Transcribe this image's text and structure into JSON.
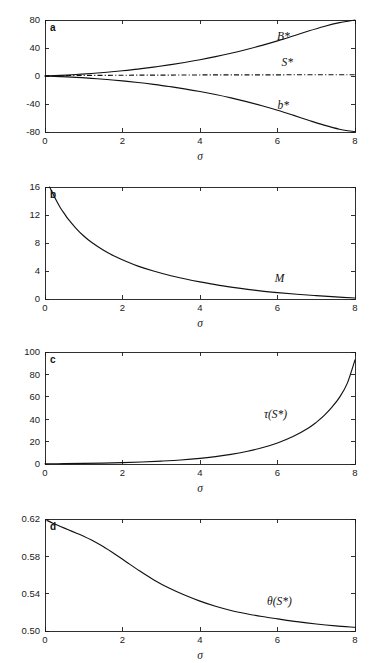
{
  "figure": {
    "background": "#ffffff",
    "ink_color": "#111111",
    "panel_count": 4
  },
  "chart_data": [
    {
      "type": "line",
      "panel": "a",
      "panel_label": "a",
      "title": "",
      "xlabel": "σ",
      "ylabel": "",
      "xlim": [
        0,
        8
      ],
      "ylim": [
        -80,
        80
      ],
      "xticks": [
        0,
        2,
        4,
        6,
        8
      ],
      "xticklabels": [
        "0",
        "2",
        "4",
        "6",
        "8"
      ],
      "yticks": [
        -80,
        -40,
        0,
        40,
        80
      ],
      "yticklabels": [
        "-80",
        "-40",
        "0",
        "40",
        "80"
      ],
      "grid": false,
      "legend": "none",
      "series": [
        {
          "name": "B*",
          "label": "B*",
          "label_x": 6.15,
          "label_y": 52,
          "style": "solid",
          "x": [
            0,
            0.4,
            0.8,
            1.2,
            1.6,
            2.0,
            2.4,
            2.8,
            3.2,
            3.6,
            4.0,
            4.4,
            4.8,
            5.2,
            5.6,
            6.0,
            6.4,
            6.8,
            7.2,
            7.6,
            8.0
          ],
          "values": [
            0,
            0.9,
            2.1,
            3.6,
            5.4,
            7.5,
            9.9,
            12.7,
            15.8,
            19.3,
            23.2,
            27.6,
            32.5,
            37.9,
            43.8,
            50.2,
            57.2,
            64.3,
            70.8,
            76.2,
            80.0
          ]
        },
        {
          "name": "S*",
          "label": "S*",
          "label_x": 6.25,
          "label_y": 14,
          "style": "dashdot",
          "x": [
            0,
            1,
            2,
            3,
            4,
            5,
            6,
            7,
            8
          ],
          "values": [
            0.4,
            0.8,
            1.1,
            1.3,
            1.5,
            1.6,
            1.7,
            1.75,
            1.8
          ]
        },
        {
          "name": "b*",
          "label": "b*",
          "label_x": 6.15,
          "label_y": -47,
          "style": "solid",
          "x": [
            0,
            0.4,
            0.8,
            1.2,
            1.6,
            2.0,
            2.4,
            2.8,
            3.2,
            3.6,
            4.0,
            4.4,
            4.8,
            5.2,
            5.6,
            6.0,
            6.4,
            6.8,
            7.2,
            7.6,
            8.0
          ],
          "values": [
            0,
            -0.8,
            -1.9,
            -3.3,
            -5.0,
            -7.0,
            -9.3,
            -12.0,
            -15.0,
            -18.4,
            -22.2,
            -26.5,
            -31.3,
            -36.6,
            -42.5,
            -48.9,
            -55.9,
            -63.2,
            -70.2,
            -76.0,
            -79.6
          ]
        }
      ]
    },
    {
      "type": "line",
      "panel": "b",
      "panel_label": "b",
      "title": "",
      "xlabel": "σ",
      "ylabel": "",
      "xlim": [
        0,
        8
      ],
      "ylim": [
        0,
        16
      ],
      "xticks": [
        0,
        2,
        4,
        6,
        8
      ],
      "xticklabels": [
        "0",
        "2",
        "4",
        "6",
        "8"
      ],
      "yticks": [
        0,
        4,
        8,
        12,
        16
      ],
      "yticklabels": [
        "0",
        "4",
        "8",
        "12",
        "16"
      ],
      "grid": false,
      "legend": "none",
      "series": [
        {
          "name": "M",
          "label": "M",
          "label_x": 6.05,
          "label_y": 2.4,
          "style": "solid",
          "x": [
            0.12,
            0.2,
            0.3,
            0.4,
            0.5,
            0.6,
            0.8,
            1.0,
            1.2,
            1.5,
            1.8,
            2.1,
            2.4,
            2.8,
            3.2,
            3.6,
            4.0,
            4.5,
            5.0,
            5.5,
            6.0,
            6.5,
            7.0,
            7.5,
            8.0
          ],
          "values": [
            16.0,
            15.1,
            14.0,
            13.0,
            12.2,
            11.4,
            10.1,
            9.0,
            8.1,
            7.0,
            6.1,
            5.35,
            4.7,
            4.0,
            3.4,
            2.9,
            2.45,
            1.95,
            1.55,
            1.2,
            0.92,
            0.68,
            0.48,
            0.3,
            0.14
          ]
        }
      ]
    },
    {
      "type": "line",
      "panel": "c",
      "panel_label": "c",
      "title": "",
      "xlabel": "σ",
      "ylabel": "",
      "xlim": [
        0,
        8
      ],
      "ylim": [
        0,
        100
      ],
      "xticks": [
        0,
        2,
        4,
        6,
        8
      ],
      "xticklabels": [
        "0",
        "2",
        "4",
        "6",
        "8"
      ],
      "yticks": [
        0,
        20,
        40,
        60,
        80,
        100
      ],
      "yticklabels": [
        "0",
        "20",
        "40",
        "60",
        "80",
        "100"
      ],
      "grid": false,
      "legend": "none",
      "series": [
        {
          "name": "tau(S*)",
          "label": "τ(S*)",
          "label_x": 5.95,
          "label_y": 41,
          "style": "solid",
          "x": [
            0,
            0.5,
            1.0,
            1.5,
            2.0,
            2.5,
            3.0,
            3.5,
            4.0,
            4.4,
            4.8,
            5.2,
            5.6,
            6.0,
            6.4,
            6.8,
            7.0,
            7.2,
            7.4,
            7.6,
            7.8,
            8.0
          ],
          "values": [
            0.2,
            0.3,
            0.5,
            0.8,
            1.2,
            1.8,
            2.6,
            3.6,
            5.0,
            6.6,
            8.6,
            11.2,
            14.5,
            18.8,
            24.5,
            32.2,
            37.2,
            43.2,
            50.5,
            59.5,
            72.0,
            93.0
          ]
        }
      ]
    },
    {
      "type": "line",
      "panel": "d",
      "panel_label": "d",
      "title": "",
      "xlabel": "σ",
      "ylabel": "",
      "xlim": [
        0,
        8
      ],
      "ylim": [
        0.5,
        0.62
      ],
      "xticks": [
        0,
        2,
        4,
        6,
        8
      ],
      "xticklabels": [
        "0",
        "2",
        "4",
        "6",
        "8"
      ],
      "yticks": [
        0.5,
        0.54,
        0.58,
        0.62
      ],
      "yticklabels": [
        "0.50",
        "0.54",
        "0.58",
        "0.62"
      ],
      "grid": false,
      "legend": "none",
      "series": [
        {
          "name": "theta(S*)",
          "label": "θ(S*)",
          "label_x": 6.05,
          "label_y": 0.5275,
          "style": "solid",
          "x": [
            0.05,
            0.2,
            0.4,
            0.6,
            0.8,
            1.0,
            1.2,
            1.5,
            1.8,
            2.1,
            2.4,
            2.8,
            3.2,
            3.6,
            4.0,
            4.4,
            4.8,
            5.2,
            5.6,
            6.0,
            6.5,
            7.0,
            7.5,
            8.0
          ],
          "values": [
            0.6185,
            0.6155,
            0.612,
            0.6085,
            0.605,
            0.6015,
            0.5975,
            0.5905,
            0.5825,
            0.574,
            0.5655,
            0.555,
            0.546,
            0.5385,
            0.532,
            0.5265,
            0.522,
            0.5185,
            0.5155,
            0.513,
            0.51,
            0.5075,
            0.5055,
            0.504
          ]
        }
      ]
    }
  ]
}
